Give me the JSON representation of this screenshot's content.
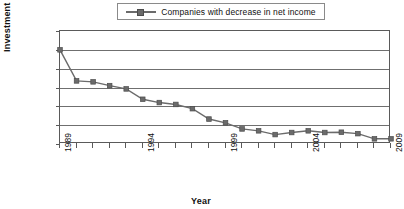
{
  "chart_data": {
    "type": "line",
    "title": "",
    "xlabel": "Year",
    "ylabel": "Investment Value",
    "grid": true,
    "legend_position": "top-center",
    "xlim": [
      1989,
      2009
    ],
    "ylim": [
      0,
      1200
    ],
    "y_ticks": [
      0,
      200,
      400,
      600,
      800,
      1000,
      1200
    ],
    "y_tick_labels": [
      "$0",
      "$200",
      "$400",
      "$600",
      "$800",
      "$1,000",
      "$1,200"
    ],
    "x_ticks": [
      1989,
      1994,
      1999,
      2004,
      2009
    ],
    "x_tick_labels": [
      "1989",
      "1994",
      "1999",
      "2004",
      "2009"
    ],
    "x": [
      1989,
      1990,
      1991,
      1992,
      1993,
      1994,
      1995,
      1996,
      1997,
      1998,
      1999,
      2000,
      2001,
      2002,
      2003,
      2004,
      2005,
      2006,
      2007,
      2008,
      2009
    ],
    "series": [
      {
        "name": "Companies with decrease in net income",
        "marker": "square",
        "color": "#6b6b6b",
        "values": [
          1000,
          670,
          660,
          620,
          585,
          475,
          440,
          420,
          375,
          265,
          225,
          160,
          140,
          100,
          122,
          140,
          122,
          125,
          110,
          55,
          55
        ]
      }
    ]
  },
  "legend": {
    "entries": [
      {
        "label": "Companies with decrease in net income"
      }
    ]
  },
  "axes": {
    "y_title": "Investment Value",
    "x_title": "Year"
  }
}
